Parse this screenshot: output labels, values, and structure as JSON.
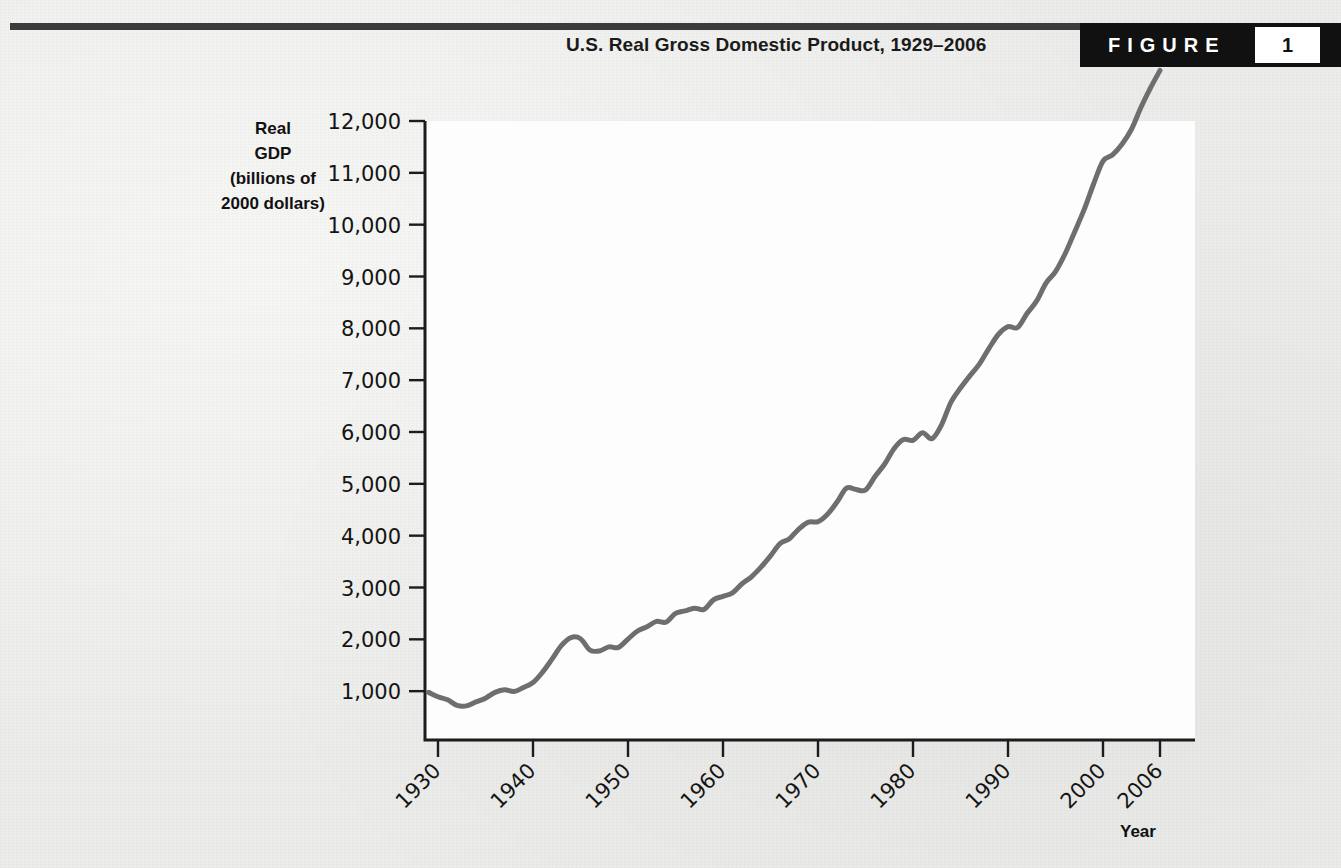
{
  "header": {
    "title": "U.S. Real Gross Domestic Product, 1929–2006",
    "figure_word": "FIGURE",
    "figure_number": "1"
  },
  "axes": {
    "y_title_lines": [
      "Real",
      "GDP",
      "(billions of",
      "2000 dollars)"
    ],
    "x_title": "Year"
  },
  "colors": {
    "line": "#6e6e6e",
    "background": "#ececea",
    "plot_background": "#fdfdfd",
    "axis": "#1c1c1c",
    "badge": "#111111",
    "text": "#141414"
  },
  "chart_data": {
    "type": "line",
    "title": "U.S. Real Gross Domestic Product, 1929–2006",
    "xlabel": "Year",
    "ylabel": "Real GDP (billions of 2000 dollars)",
    "xlim": [
      1929,
      2006
    ],
    "ylim": [
      0,
      12000
    ],
    "grid": false,
    "legend": null,
    "y_ticks": [
      1000,
      2000,
      3000,
      4000,
      5000,
      6000,
      7000,
      8000,
      9000,
      10000,
      11000,
      12000
    ],
    "y_tick_labels": [
      "1,000",
      "2,000",
      "3,000",
      "4,000",
      "5,000",
      "6,000",
      "7,000",
      "8,000",
      "9,000",
      "10,000",
      "11,000",
      "12,000"
    ],
    "x_ticks": [
      1930,
      1940,
      1950,
      1960,
      1970,
      1980,
      1990,
      2000,
      2006
    ],
    "x_tick_labels": [
      "1930",
      "1940",
      "1950",
      "1960",
      "1970",
      "1980",
      "1990",
      "2000",
      "2006"
    ],
    "series": [
      {
        "name": "Real GDP",
        "x": [
          1929,
          1930,
          1931,
          1932,
          1933,
          1934,
          1935,
          1936,
          1937,
          1938,
          1939,
          1940,
          1941,
          1942,
          1943,
          1944,
          1945,
          1946,
          1947,
          1948,
          1949,
          1950,
          1951,
          1952,
          1953,
          1954,
          1955,
          1956,
          1957,
          1958,
          1959,
          1960,
          1961,
          1962,
          1963,
          1964,
          1965,
          1966,
          1967,
          1968,
          1969,
          1970,
          1971,
          1972,
          1973,
          1974,
          1975,
          1976,
          1977,
          1978,
          1979,
          1980,
          1981,
          1982,
          1983,
          1984,
          1985,
          1986,
          1987,
          1988,
          1989,
          1990,
          1991,
          1992,
          1993,
          1994,
          1995,
          1996,
          1997,
          1998,
          1999,
          2000,
          2001,
          2002,
          2003,
          2004,
          2005,
          2006
        ],
        "values": [
          977,
          892,
          834,
          725,
          716,
          794,
          865,
          977,
          1028,
          992,
          1072,
          1166,
          1366,
          1618,
          1883,
          2035,
          2012,
          1792,
          1776,
          1854,
          1844,
          2006,
          2161,
          2244,
          2347,
          2332,
          2500,
          2549,
          2601,
          2577,
          2762,
          2830,
          2897,
          3072,
          3207,
          3392,
          3610,
          3845,
          3942,
          4133,
          4262,
          4270,
          4413,
          4648,
          4917,
          4890,
          4880,
          5141,
          5378,
          5678,
          5855,
          5839,
          5987,
          5871,
          6136,
          6577,
          6849,
          7087,
          7313,
          7614,
          7886,
          8034,
          8015,
          8287,
          8524,
          8871,
          9094,
          9434,
          9854,
          10284,
          10780,
          11226,
          11348,
          11553,
          11841,
          12264,
          12638,
          12976
        ]
      }
    ]
  }
}
